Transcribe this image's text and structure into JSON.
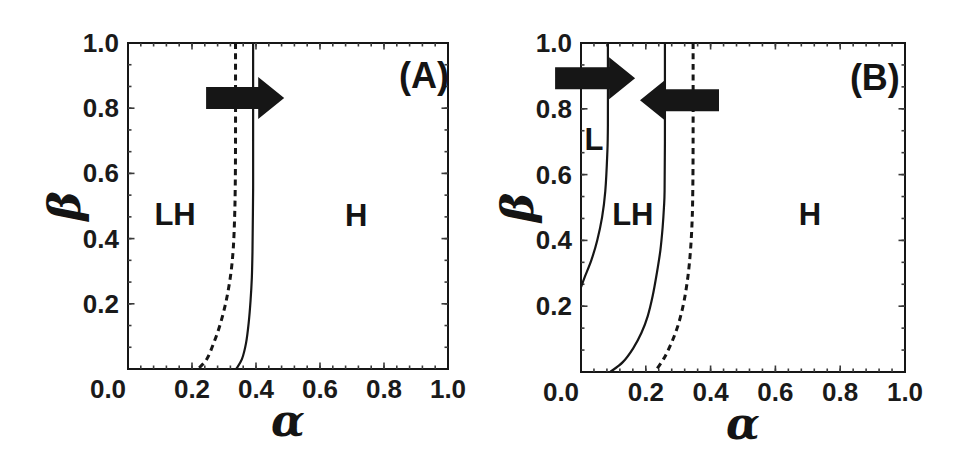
{
  "figure": {
    "background": "#ffffff",
    "ink": "#161616",
    "tick_color": "#3a3a3a"
  },
  "chart_data": [
    {
      "type": "line",
      "panel_label": "(A)",
      "xlabel": "α",
      "ylabel": "β",
      "xlim": [
        0.0,
        1.0
      ],
      "ylim": [
        0.0,
        1.0
      ],
      "grid": false,
      "xtick_labels": [
        "0.0",
        "0.2",
        "0.4",
        "0.6",
        "0.8",
        "1.0"
      ],
      "ytick_labels": [
        "0.0",
        "0.2",
        "0.4",
        "0.6",
        "0.8",
        "1.0"
      ],
      "series": [
        {
          "name": "LH-H boundary (solid)",
          "style": "solid",
          "points": [
            [
              0.391,
              1.0
            ],
            [
              0.391,
              0.7
            ],
            [
              0.391,
              0.55
            ],
            [
              0.39,
              0.45
            ],
            [
              0.389,
              0.36
            ],
            [
              0.387,
              0.28
            ],
            [
              0.383,
              0.21
            ],
            [
              0.377,
              0.14
            ],
            [
              0.369,
              0.08
            ],
            [
              0.356,
              0.03
            ],
            [
              0.338,
              0.0
            ]
          ]
        },
        {
          "name": "LH-H boundary (dashed)",
          "style": "dashed",
          "points": [
            [
              0.336,
              1.0
            ],
            [
              0.336,
              0.7
            ],
            [
              0.335,
              0.55
            ],
            [
              0.333,
              0.46
            ],
            [
              0.329,
              0.37
            ],
            [
              0.321,
              0.29
            ],
            [
              0.307,
              0.21
            ],
            [
              0.289,
              0.14
            ],
            [
              0.268,
              0.08
            ],
            [
              0.246,
              0.03
            ],
            [
              0.219,
              0.0
            ]
          ]
        }
      ],
      "region_labels": [
        {
          "text": "LH",
          "alpha": 0.147,
          "beta": 0.475
        },
        {
          "text": "H",
          "alpha": 0.713,
          "beta": 0.472
        }
      ],
      "arrows": [
        {
          "direction": "right",
          "beta": 0.831,
          "alpha_tail": 0.244,
          "alpha_tip": 0.488
        }
      ]
    },
    {
      "type": "line",
      "panel_label": "(B)",
      "xlabel": "α",
      "ylabel": "β",
      "xlim": [
        0.0,
        1.0
      ],
      "ylim": [
        0.0,
        1.0
      ],
      "grid": false,
      "xtick_labels": [
        "0.0",
        "0.2",
        "0.4",
        "0.6",
        "0.8",
        "1.0"
      ],
      "ytick_labels": [
        "0.0",
        "0.2",
        "0.4",
        "0.6",
        "0.8",
        "1.0"
      ],
      "series": [
        {
          "name": "L-LH boundary (solid)",
          "style": "solid",
          "points": [
            [
              0.083,
              1.0
            ],
            [
              0.083,
              0.75
            ],
            [
              0.081,
              0.66
            ],
            [
              0.075,
              0.55
            ],
            [
              0.065,
              0.47
            ],
            [
              0.05,
              0.4
            ],
            [
              0.032,
              0.34
            ],
            [
              0.012,
              0.29
            ],
            [
              0.0,
              0.258
            ]
          ]
        },
        {
          "name": "LH-H boundary (solid)",
          "style": "solid",
          "points": [
            [
              0.259,
              1.0
            ],
            [
              0.259,
              0.7
            ],
            [
              0.258,
              0.55
            ],
            [
              0.256,
              0.5
            ],
            [
              0.252,
              0.44
            ],
            [
              0.245,
              0.37
            ],
            [
              0.234,
              0.3
            ],
            [
              0.221,
              0.23
            ],
            [
              0.206,
              0.17
            ],
            [
              0.187,
              0.12
            ],
            [
              0.161,
              0.072
            ],
            [
              0.129,
              0.03
            ],
            [
              0.09,
              0.0
            ]
          ]
        },
        {
          "name": "LH-H boundary (dashed)",
          "style": "dashed",
          "points": [
            [
              0.346,
              1.0
            ],
            [
              0.346,
              0.7
            ],
            [
              0.345,
              0.55
            ],
            [
              0.343,
              0.46
            ],
            [
              0.338,
              0.37
            ],
            [
              0.33,
              0.29
            ],
            [
              0.318,
              0.215
            ],
            [
              0.302,
              0.15
            ],
            [
              0.282,
              0.095
            ],
            [
              0.258,
              0.045
            ],
            [
              0.228,
              0.0
            ]
          ]
        }
      ],
      "region_labels": [
        {
          "text": "L",
          "alpha": 0.04,
          "beta": 0.707
        },
        {
          "text": "LH",
          "alpha": 0.16,
          "beta": 0.478
        },
        {
          "text": "H",
          "alpha": 0.707,
          "beta": 0.478
        }
      ],
      "arrows": [
        {
          "direction": "right",
          "beta": 0.893,
          "alpha_tail": -0.08,
          "alpha_tip": 0.167
        },
        {
          "direction": "left",
          "beta": 0.826,
          "alpha_tail": 0.426,
          "alpha_tip": 0.182
        }
      ]
    }
  ]
}
